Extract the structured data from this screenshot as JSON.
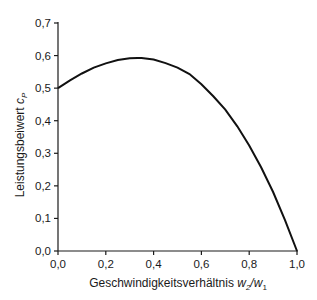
{
  "chart_data": {
    "type": "line",
    "title": "",
    "xlabel": "Geschwindigkeitsverhältnis w2/w1",
    "xlabel_parts": {
      "text": "Geschwindigkeitsverhältnis ",
      "var1": "w",
      "sub1": "2",
      "slash": "/",
      "var2": "w",
      "sub2": "1"
    },
    "ylabel": "Leistungsbeiwert cP",
    "ylabel_parts": {
      "text": "Leistungsbeiwert ",
      "var": "c",
      "sub": "P"
    },
    "xlim": [
      0.0,
      1.0
    ],
    "ylim": [
      0.0,
      0.7
    ],
    "x_ticks": [
      "0,0",
      "0,2",
      "0,4",
      "0,6",
      "0,8",
      "1,0"
    ],
    "x_tick_values": [
      0.0,
      0.2,
      0.4,
      0.6,
      0.8,
      1.0
    ],
    "y_ticks": [
      "0,0",
      "0,1",
      "0,2",
      "0,3",
      "0,4",
      "0,5",
      "0,6",
      "0,7"
    ],
    "y_tick_values": [
      0.0,
      0.1,
      0.2,
      0.3,
      0.4,
      0.5,
      0.6,
      0.7
    ],
    "grid": false,
    "legend": null,
    "series": [
      {
        "name": "cP",
        "x": [
          0.0,
          0.05,
          0.1,
          0.15,
          0.2,
          0.25,
          0.3,
          0.333,
          0.35,
          0.4,
          0.45,
          0.5,
          0.55,
          0.6,
          0.65,
          0.7,
          0.75,
          0.8,
          0.85,
          0.9,
          0.95,
          1.0
        ],
        "values": [
          0.5,
          0.524,
          0.545,
          0.563,
          0.576,
          0.586,
          0.592,
          0.593,
          0.593,
          0.588,
          0.577,
          0.563,
          0.543,
          0.512,
          0.475,
          0.434,
          0.383,
          0.324,
          0.257,
          0.181,
          0.095,
          0.0
        ]
      }
    ]
  }
}
